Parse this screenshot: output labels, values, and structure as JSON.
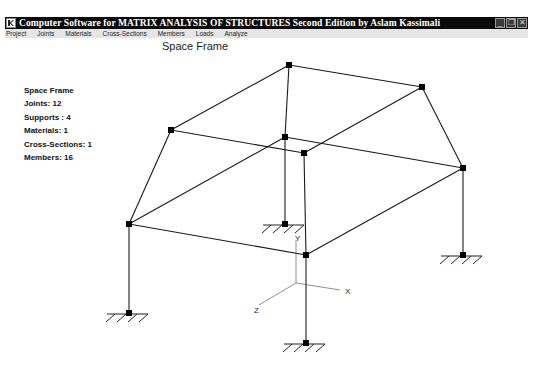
{
  "window": {
    "title": "Computer Software for MATRIX ANALYSIS OF STRUCTURES Second Edition by Aslam Kassimali",
    "buttons": [
      "minimize",
      "restore",
      "close"
    ]
  },
  "menu": {
    "items": [
      "Project",
      "Joints",
      "Materials",
      "Cross-Sections",
      "Members",
      "Loads",
      "Analyze"
    ]
  },
  "view": {
    "title": "Space Frame"
  },
  "info": {
    "name": "Space Frame",
    "joints": "Joints: 12",
    "supports": "Supports : 4",
    "materials": "Materials: 1",
    "cross_sections": "Cross-Sections: 1",
    "members": "Members: 16"
  },
  "structure": {
    "joints": [
      {
        "id": 1,
        "x": 289,
        "y": 65
      },
      {
        "id": 2,
        "x": 422,
        "y": 87
      },
      {
        "id": 3,
        "x": 171,
        "y": 130
      },
      {
        "id": 4,
        "x": 285,
        "y": 137
      },
      {
        "id": 5,
        "x": 304,
        "y": 153
      },
      {
        "id": 6,
        "x": 463,
        "y": 168
      },
      {
        "id": 7,
        "x": 129,
        "y": 224
      },
      {
        "id": 8,
        "x": 285,
        "y": 224,
        "support": true
      },
      {
        "id": 9,
        "x": 306,
        "y": 255
      },
      {
        "id": 10,
        "x": 463,
        "y": 255,
        "support": true
      },
      {
        "id": 11,
        "x": 129,
        "y": 313,
        "support": true
      },
      {
        "id": 12,
        "x": 306,
        "y": 343,
        "support": true
      }
    ],
    "members": [
      [
        1,
        2
      ],
      [
        1,
        3
      ],
      [
        1,
        4
      ],
      [
        2,
        5
      ],
      [
        2,
        6
      ],
      [
        3,
        5
      ],
      [
        3,
        7
      ],
      [
        4,
        6
      ],
      [
        4,
        7
      ],
      [
        4,
        8
      ],
      [
        5,
        9
      ],
      [
        7,
        9
      ],
      [
        9,
        6
      ],
      [
        6,
        10
      ],
      [
        7,
        11
      ],
      [
        9,
        12
      ]
    ],
    "line_color": "#1a1a1a",
    "joint_color": "#000000"
  },
  "axes": {
    "origin": {
      "x": 296,
      "y": 283
    },
    "x_label": "X",
    "y_label": "Y",
    "z_label": "Z"
  },
  "statusbar": {
    "text": ""
  }
}
